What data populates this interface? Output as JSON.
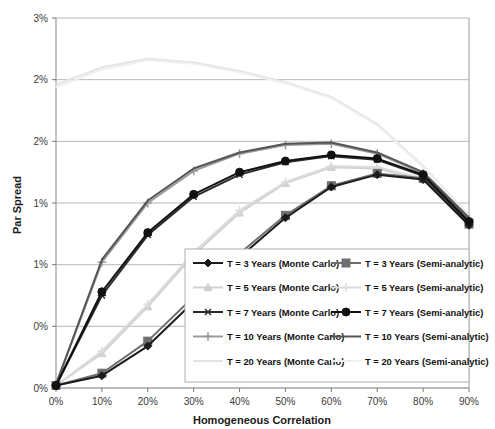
{
  "chart_data": {
    "type": "line",
    "title": "",
    "xlabel": "Homogeneous Correlation",
    "ylabel": "Par Spread",
    "x": [
      0,
      10,
      20,
      30,
      40,
      50,
      60,
      70,
      80,
      90
    ],
    "xtick_labels": [
      "0%",
      "10%",
      "20%",
      "30%",
      "40%",
      "50%",
      "60%",
      "70%",
      "80%",
      "90%"
    ],
    "ytick_labels": [
      "3%",
      "2%",
      "2%",
      "1%",
      "1%",
      "0%"
    ],
    "ytick_values": [
      3.0,
      2.5,
      2.0,
      1.5,
      1.0,
      0.5,
      0.0
    ],
    "xlim": [
      0,
      90
    ],
    "ylim": [
      0.0,
      3.0
    ],
    "grid": true,
    "legend_position": "inside-bottom-right",
    "legend_columns": 2,
    "series": [
      {
        "name": "T = 3 Years (Monte Carlo)",
        "color": "#1c1c1c",
        "marker": "diamond",
        "values": [
          0.02,
          0.1,
          0.34,
          0.7,
          1.06,
          1.38,
          1.63,
          1.73,
          1.69,
          1.32
        ]
      },
      {
        "name": "T = 5 Years (Monte Carlo)",
        "color": "#d0d0d0",
        "marker": "triangle",
        "values": [
          0.02,
          0.28,
          0.66,
          1.08,
          1.42,
          1.66,
          1.79,
          1.78,
          1.69,
          1.32
        ]
      },
      {
        "name": "T = 7 Years (Monte Carlo)",
        "color": "#2a2a2a",
        "marker": "asterisk",
        "values": [
          0.02,
          0.75,
          1.24,
          1.55,
          1.73,
          1.83,
          1.88,
          1.85,
          1.72,
          1.34
        ]
      },
      {
        "name": "T = 10 Years (Monte Carlo)",
        "color": "#9a9a9a",
        "marker": "plus",
        "values": [
          0.03,
          1.02,
          1.5,
          1.76,
          1.9,
          1.97,
          1.98,
          1.9,
          1.74,
          1.37
        ]
      },
      {
        "name": "T = 20 Years (Monte Carlo)",
        "color": "#e3e3e3",
        "marker": "none",
        "values": [
          2.46,
          2.6,
          2.67,
          2.64,
          2.57,
          2.48,
          2.36,
          2.14,
          1.8,
          1.4
        ]
      },
      {
        "name": "T = 3 Years (Semi-analytic)",
        "color": "#6e6e6e",
        "marker": "square",
        "values": [
          0.02,
          0.12,
          0.38,
          0.74,
          1.09,
          1.4,
          1.64,
          1.74,
          1.7,
          1.33
        ]
      },
      {
        "name": "T = 5 Years (Semi-analytic)",
        "color": "#dcdcdc",
        "marker": "plus-light",
        "values": [
          0.02,
          0.3,
          0.68,
          1.1,
          1.44,
          1.67,
          1.8,
          1.79,
          1.7,
          1.33
        ]
      },
      {
        "name": "T = 7 Years (Semi-analytic)",
        "color": "#111111",
        "marker": "circle",
        "values": [
          0.02,
          0.78,
          1.26,
          1.57,
          1.75,
          1.84,
          1.89,
          1.86,
          1.73,
          1.35
        ]
      },
      {
        "name": "T = 10 Years (Semi-analytic)",
        "color": "#555555",
        "marker": "none",
        "values": [
          0.03,
          1.04,
          1.52,
          1.78,
          1.91,
          1.98,
          1.99,
          1.91,
          1.75,
          1.38
        ]
      },
      {
        "name": "T = 20 Years (Semi-analytic)",
        "color": "#efefef",
        "marker": "none",
        "values": [
          2.44,
          2.58,
          2.66,
          2.63,
          2.56,
          2.47,
          2.35,
          2.13,
          1.79,
          1.39
        ]
      }
    ]
  },
  "legend": {
    "entries": [
      "T = 3 Years (Monte Carlo)",
      "T = 3 Years (Semi-analytic)",
      "T = 5 Years (Monte Carlo)",
      "T = 5 Years (Semi-analytic)",
      "T = 7 Years (Monte Carlo)",
      "T = 7 Years (Semi-analytic)",
      "T = 10 Years (Monte Carlo)",
      "T = 10 Years (Semi-analytic)",
      "T = 20 Years (Monte Carlo)",
      "T = 20 Years (Semi-analytic)"
    ]
  },
  "style": {
    "plot_border_color": "#9a9a9a",
    "grid_color": "#b8b8b8",
    "background": "#ffffff",
    "legend_border_color": "#b0b0b0"
  }
}
